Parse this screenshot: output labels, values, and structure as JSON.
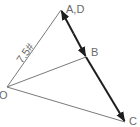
{
  "diagram": {
    "title": "",
    "points": {
      "O": {
        "label": "O",
        "x": 7,
        "y": 87
      },
      "A": {
        "label": "A,D",
        "x": 61,
        "y": 10
      },
      "B": {
        "label": "B",
        "x": 86,
        "y": 57
      },
      "C": {
        "label": "C",
        "x": 125,
        "y": 122
      }
    },
    "edges": [
      {
        "from": "O",
        "to": "A",
        "style": "thin",
        "label": "7.5#"
      },
      {
        "from": "O",
        "to": "B",
        "style": "thin",
        "label": ""
      },
      {
        "from": "O",
        "to": "C",
        "style": "thin",
        "label": ""
      },
      {
        "from": "A",
        "to": "C",
        "style": "thick-arrow",
        "label": "",
        "arrowheads": [
          "A",
          "B",
          "C"
        ]
      }
    ],
    "labels": {
      "ad": "A,D",
      "b": "B",
      "c": "C",
      "o": "O",
      "force": "7.5#"
    },
    "colors": {
      "thin_line": "#7a7a7a",
      "thick_line": "#1e1e1e",
      "text": "#6a6a6a"
    }
  }
}
